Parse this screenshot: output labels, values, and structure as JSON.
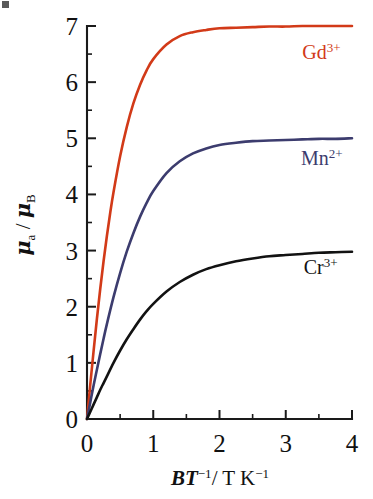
{
  "figure": {
    "name": "brillouin-magnetic-moment-plot",
    "background_color": "#ffffff"
  },
  "chart_data": {
    "type": "line",
    "title": "",
    "subtitle": "",
    "xlabel": "BT−1/ T K−1",
    "xlabel_parts": {
      "italic_b": "B",
      "italic_t": "T",
      "exp1": "−1",
      "divider": "/ T K",
      "exp2": "−1"
    },
    "ylabel": "μa / μB",
    "ylabel_parts": {
      "mu1": "μ",
      "sub1": "a",
      "slash": "/",
      "mu2": "μ",
      "sub2": "B"
    },
    "xlim": [
      0,
      4
    ],
    "ylim": [
      0,
      7
    ],
    "xticks": [
      0,
      1,
      2,
      3,
      4
    ],
    "xtick_labels": [
      "0",
      "1",
      "2",
      "3",
      "4"
    ],
    "xminor_ticks": [
      0.5,
      1.5,
      2.5,
      3.5
    ],
    "yticks": [
      0,
      1,
      2,
      3,
      4,
      5,
      6,
      7
    ],
    "ytick_labels": [
      "0",
      "1",
      "2",
      "3",
      "4",
      "5",
      "6",
      "7"
    ],
    "yminor_ticks": [
      0.5,
      1.5,
      2.5,
      3.5,
      4.5,
      5.5,
      6.5
    ],
    "grid": false,
    "legend_position": "inline-right",
    "series": [
      {
        "name": "Gd3+",
        "label": "Gd",
        "charge": "3+",
        "color": "#d23a18",
        "saturation": 7.0,
        "label_x": 3.25,
        "label_y": 6.42,
        "x": [
          0,
          0.05,
          0.1,
          0.15,
          0.2,
          0.25,
          0.3,
          0.35,
          0.4,
          0.5,
          0.6,
          0.7,
          0.8,
          0.9,
          1.0,
          1.2,
          1.4,
          1.6,
          1.8,
          2.0,
          2.25,
          2.5,
          2.75,
          3.0,
          3.25,
          3.5,
          3.75,
          4.0
        ],
        "values": [
          0,
          0.62,
          1.22,
          1.79,
          2.32,
          2.81,
          3.26,
          3.67,
          4.04,
          4.68,
          5.2,
          5.62,
          5.95,
          6.21,
          6.41,
          6.67,
          6.82,
          6.89,
          6.93,
          6.96,
          6.97,
          6.98,
          6.99,
          6.99,
          7.0,
          7.0,
          7.0,
          7.0
        ]
      },
      {
        "name": "Mn2+",
        "label": "Mn",
        "charge": "2+",
        "color": "#3c3c6e",
        "saturation": 5.0,
        "label_x": 3.23,
        "label_y": 4.52,
        "x": [
          0,
          0.05,
          0.1,
          0.15,
          0.2,
          0.25,
          0.3,
          0.4,
          0.5,
          0.6,
          0.7,
          0.8,
          0.9,
          1.0,
          1.2,
          1.4,
          1.6,
          1.8,
          2.0,
          2.25,
          2.5,
          2.75,
          3.0,
          3.25,
          3.5,
          3.75,
          4.0
        ],
        "values": [
          0,
          0.3,
          0.6,
          0.88,
          1.16,
          1.43,
          1.69,
          2.17,
          2.6,
          2.98,
          3.31,
          3.6,
          3.85,
          4.06,
          4.38,
          4.59,
          4.73,
          4.82,
          4.88,
          4.92,
          4.95,
          4.96,
          4.97,
          4.98,
          4.99,
          4.99,
          5.0
        ]
      },
      {
        "name": "Cr3+",
        "label": "Cr",
        "charge": "3+",
        "color": "#121212",
        "saturation": 3.0,
        "label_x": 3.27,
        "label_y": 2.58,
        "x": [
          0,
          0.05,
          0.1,
          0.15,
          0.2,
          0.25,
          0.3,
          0.4,
          0.5,
          0.6,
          0.7,
          0.8,
          0.9,
          1.0,
          1.2,
          1.4,
          1.6,
          1.8,
          2.0,
          2.25,
          2.5,
          2.75,
          3.0,
          3.25,
          3.5,
          3.75,
          4.0
        ],
        "values": [
          0,
          0.13,
          0.26,
          0.39,
          0.52,
          0.64,
          0.76,
          1.0,
          1.22,
          1.42,
          1.6,
          1.77,
          1.92,
          2.05,
          2.27,
          2.44,
          2.57,
          2.67,
          2.74,
          2.81,
          2.86,
          2.9,
          2.92,
          2.94,
          2.96,
          2.97,
          2.98
        ]
      }
    ]
  }
}
